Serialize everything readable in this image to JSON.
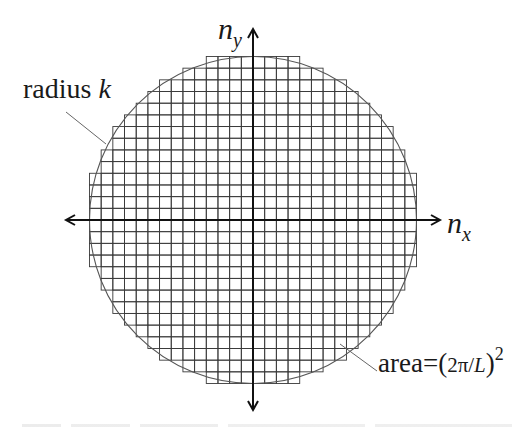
{
  "diagram": {
    "labels": {
      "radius_text": "radius ",
      "radius_var": "k",
      "area_text": "area=",
      "area_expr_open": "(",
      "area_expr_inner": "2π/",
      "area_expr_var": "L",
      "area_expr_close": ")",
      "area_exponent": "2",
      "x_axis_var": "n",
      "x_axis_sub": "x",
      "y_axis_var": "n",
      "y_axis_sub": "y"
    },
    "geometry": {
      "center_x": 253,
      "center_y": 220,
      "cell_size": 11.68,
      "radius_cells": 14,
      "circle_radius_px": 163.5,
      "x_axis": {
        "x1": 66,
        "x2": 440,
        "y": 220
      },
      "y_axis": {
        "x": 253,
        "y1": 29,
        "y2": 410
      },
      "radius_leader": {
        "x1": 66,
        "y1": 112,
        "x2": 106,
        "y2": 144
      },
      "area_leader": {
        "x1": 340,
        "y1": 344,
        "x2": 377,
        "y2": 371
      }
    },
    "colors": {
      "grid": "#3a3a3a",
      "grid_outer": "#8a8a8a",
      "circle": "#555555",
      "axis": "#111111",
      "leader": "#666666"
    }
  }
}
